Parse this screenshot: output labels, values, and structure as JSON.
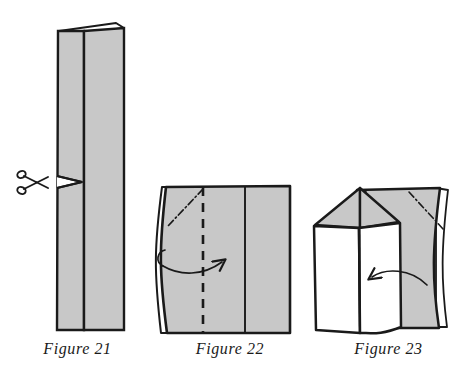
{
  "document": {
    "kind": "origami-instruction-plate",
    "background_color": "#ffffff",
    "ink_color": "#1a1a1a",
    "paper_fill": "#c8c8c8",
    "paper_back_fill": "#ffffff",
    "figure_count": 3
  },
  "figures": [
    {
      "id": "figure-21",
      "caption": "Figure 21",
      "description": "Tall narrow folded strip of paper seen edge-on, with a folded flap at the top and a small notch cut into the left edge at mid height.",
      "fill": "#c8c8c8",
      "annotations": [
        {
          "type": "scissors-icon",
          "name": "scissors-icon",
          "label": "cut here"
        },
        {
          "type": "notch",
          "name": "cut-notch",
          "label": "snip"
        }
      ]
    },
    {
      "id": "figure-22",
      "caption": "Figure 22",
      "description": "Wide gray rectangle of folded paper with a dashed vertical valley-fold line, a dash-dot diagonal crease in the upper left, and a curved arrow pointing right.",
      "fill": "#c8c8c8",
      "annotations": [
        {
          "type": "dashed-fold-line",
          "name": "dashed-fold-line",
          "label": "fold line"
        },
        {
          "type": "dash-dot-crease",
          "name": "diagonal-crease-line",
          "label": "existing crease"
        },
        {
          "type": "curved-arrow-right",
          "name": "fold-arrow-right",
          "label": "fold this way"
        }
      ]
    },
    {
      "id": "figure-23",
      "caption": "Figure 23",
      "description": "Paper house shape: white front panels with a triangular gabled roof on the left, gray back panel on the right, dash-dot crease at upper right, and a curved arrow pointing left.",
      "fill": "#c8c8c8",
      "annotations": [
        {
          "type": "dash-dot-crease",
          "name": "diagonal-crease-line",
          "label": "existing crease"
        },
        {
          "type": "curved-arrow-left",
          "name": "fold-arrow-left",
          "label": "fold this way"
        },
        {
          "type": "roof",
          "name": "roof-gable",
          "label": "gable"
        }
      ]
    }
  ],
  "captions": {
    "figure_21": "Figure 21",
    "figure_22": "Figure 22",
    "figure_23": "Figure 23"
  }
}
